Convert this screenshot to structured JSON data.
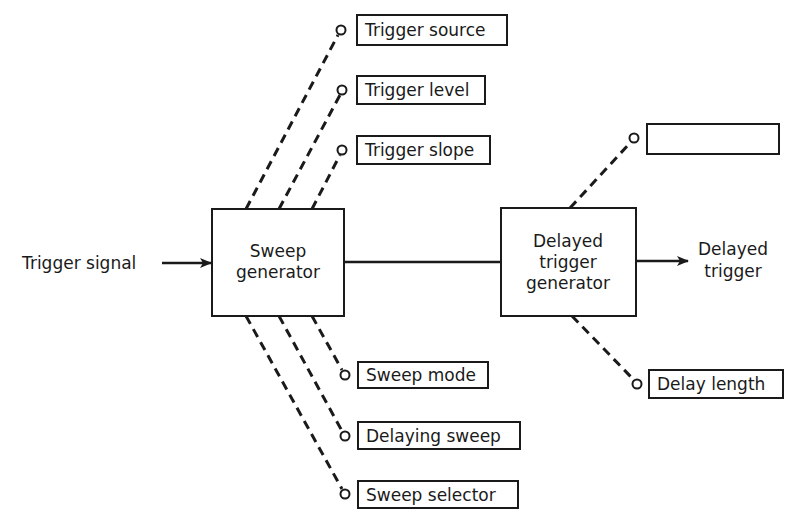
{
  "diagram": {
    "type": "block-diagram",
    "input": {
      "label": "Trigger signal"
    },
    "output": {
      "label_line1": "Delayed",
      "label_line2": "trigger"
    },
    "blocks": {
      "sweep_generator": {
        "line1": "Sweep",
        "line2": "generator"
      },
      "delayed_trigger_generator": {
        "line1": "Delayed",
        "line2": "trigger",
        "line3": "generator"
      }
    },
    "sweep_controls_top": [
      {
        "label": "Trigger source"
      },
      {
        "label": "Trigger level"
      },
      {
        "label": "Trigger slope"
      }
    ],
    "sweep_controls_bottom": [
      {
        "label": "Sweep mode"
      },
      {
        "label": "Delaying sweep"
      },
      {
        "label": "Sweep selector"
      }
    ],
    "delay_controls": {
      "top": {
        "label": ""
      },
      "bottom": {
        "label": "Delay length"
      }
    },
    "edges": [
      {
        "from": "Trigger signal",
        "to": "Sweep generator",
        "style": "arrow"
      },
      {
        "from": "Sweep generator",
        "to": "Delayed trigger generator",
        "style": "solid"
      },
      {
        "from": "Delayed trigger generator",
        "to": "Delayed trigger",
        "style": "arrow"
      },
      {
        "from": "Trigger source",
        "to": "Sweep generator",
        "style": "dashed"
      },
      {
        "from": "Trigger level",
        "to": "Sweep generator",
        "style": "dashed"
      },
      {
        "from": "Trigger slope",
        "to": "Sweep generator",
        "style": "dashed"
      },
      {
        "from": "Sweep mode",
        "to": "Sweep generator",
        "style": "dashed"
      },
      {
        "from": "Delaying sweep",
        "to": "Sweep generator",
        "style": "dashed"
      },
      {
        "from": "Sweep selector",
        "to": "Sweep generator",
        "style": "dashed"
      },
      {
        "from": "(unlabeled control)",
        "to": "Delayed trigger generator",
        "style": "dashed"
      },
      {
        "from": "Delay length",
        "to": "Delayed trigger generator",
        "style": "dashed"
      }
    ]
  }
}
